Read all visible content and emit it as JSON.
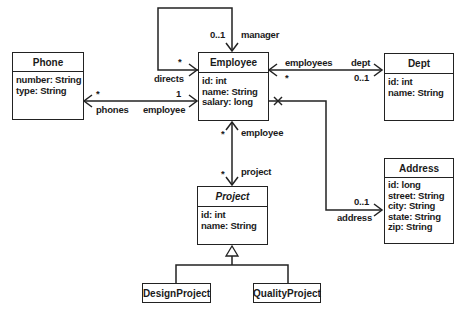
{
  "classes": {
    "phone": {
      "name": "Phone",
      "attributes": [
        "number: String",
        "type: String"
      ]
    },
    "employee": {
      "name": "Employee",
      "attributes": [
        "id: int",
        "name: String",
        "salary: long"
      ]
    },
    "dept": {
      "name": "Dept",
      "attributes": [
        "id: int",
        "name: String"
      ]
    },
    "project": {
      "name": "Project",
      "abstract": true,
      "attributes": [
        "id: int",
        "name: String"
      ]
    },
    "address": {
      "name": "Address",
      "attributes": [
        "id: long",
        "street: String",
        "city: String",
        "state: String",
        "zip: String"
      ]
    },
    "design_project": {
      "name": "DesignProject"
    },
    "quality_project": {
      "name": "QualityProject"
    }
  },
  "associations": {
    "manager": {
      "mult_manager": "0..1",
      "role_manager": "manager",
      "mult_directs": "*",
      "role_directs": "directs"
    },
    "phones": {
      "mult_phones": "*",
      "role_phones": "phones",
      "mult_employee": "1",
      "role_employee": "employee"
    },
    "dept": {
      "role_employees": "employees",
      "mult_employees": "*",
      "role_dept": "dept",
      "mult_dept": "0..1"
    },
    "project": {
      "mult_employee": "*",
      "role_employee": "employee",
      "mult_project": "*",
      "role_project": "project"
    },
    "address": {
      "mult_address": "0..1",
      "role_address": "address"
    }
  },
  "colors": {
    "line": "#222222",
    "background": "#ffffff"
  }
}
